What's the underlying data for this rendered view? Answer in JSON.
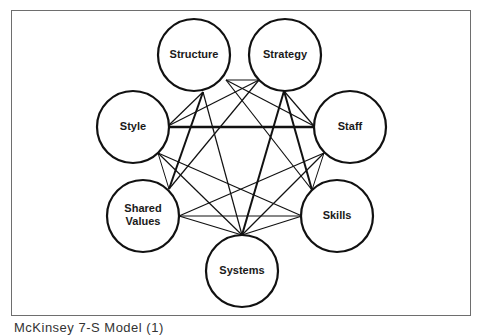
{
  "diagram": {
    "frame_color": "#6e6e6e",
    "stroke_color": "#111111",
    "nodes": [
      {
        "id": "structure",
        "label": "Structure",
        "lines": [
          "Structure"
        ],
        "cx": 194,
        "cy": 55,
        "r": 36
      },
      {
        "id": "strategy",
        "label": "Strategy",
        "lines": [
          "Strategy"
        ],
        "cx": 285,
        "cy": 55,
        "r": 36
      },
      {
        "id": "style",
        "label": "Style",
        "lines": [
          "Style"
        ],
        "cx": 133,
        "cy": 127,
        "r": 36
      },
      {
        "id": "staff",
        "label": "Staff",
        "lines": [
          "Staff"
        ],
        "cx": 350,
        "cy": 127,
        "r": 36
      },
      {
        "id": "shared-values",
        "label": "Shared Values",
        "lines": [
          "Shared",
          "Values"
        ],
        "cx": 143,
        "cy": 216,
        "r": 36
      },
      {
        "id": "skills",
        "label": "Skills",
        "lines": [
          "Skills"
        ],
        "cx": 337,
        "cy": 216,
        "r": 36
      },
      {
        "id": "systems",
        "label": "Systems",
        "lines": [
          "Systems"
        ],
        "cx": 242,
        "cy": 271,
        "r": 36
      }
    ],
    "edges": [
      {
        "from": "structure",
        "to": "strategy",
        "x1": 226,
        "y1": 80,
        "x2": 259,
        "y2": 80,
        "w": 1.2
      },
      {
        "from": "structure",
        "to": "style",
        "x1": 203,
        "y1": 92,
        "x2": 168,
        "y2": 126,
        "w": 1.2
      },
      {
        "from": "structure",
        "to": "staff",
        "x1": 226,
        "y1": 80,
        "x2": 314,
        "y2": 126,
        "w": 1.2
      },
      {
        "from": "structure",
        "to": "shared-values",
        "x1": 203,
        "y1": 92,
        "x2": 169,
        "y2": 189,
        "w": 2
      },
      {
        "from": "structure",
        "to": "skills",
        "x1": 226,
        "y1": 80,
        "x2": 312,
        "y2": 190,
        "w": 1.2
      },
      {
        "from": "structure",
        "to": "systems",
        "x1": 203,
        "y1": 92,
        "x2": 242,
        "y2": 235,
        "w": 1.2
      },
      {
        "from": "strategy",
        "to": "style",
        "x1": 259,
        "y1": 80,
        "x2": 168,
        "y2": 126,
        "w": 1.2
      },
      {
        "from": "strategy",
        "to": "staff",
        "x1": 284,
        "y1": 91,
        "x2": 314,
        "y2": 126,
        "w": 1.2
      },
      {
        "from": "strategy",
        "to": "shared-values",
        "x1": 259,
        "y1": 80,
        "x2": 169,
        "y2": 189,
        "w": 1.2
      },
      {
        "from": "strategy",
        "to": "skills",
        "x1": 284,
        "y1": 91,
        "x2": 312,
        "y2": 190,
        "w": 2
      },
      {
        "from": "strategy",
        "to": "systems",
        "x1": 284,
        "y1": 91,
        "x2": 242,
        "y2": 235,
        "w": 2
      },
      {
        "from": "style",
        "to": "staff",
        "x1": 168,
        "y1": 127,
        "x2": 314,
        "y2": 127,
        "w": 2.4
      },
      {
        "from": "style",
        "to": "shared-values",
        "x1": 158,
        "y1": 153,
        "x2": 169,
        "y2": 189,
        "w": 1
      },
      {
        "from": "style",
        "to": "skills",
        "x1": 158,
        "y1": 153,
        "x2": 302,
        "y2": 216,
        "w": 1.2
      },
      {
        "from": "style",
        "to": "systems",
        "x1": 158,
        "y1": 153,
        "x2": 242,
        "y2": 235,
        "w": 1.2
      },
      {
        "from": "staff",
        "to": "shared-values",
        "x1": 324,
        "y1": 153,
        "x2": 179,
        "y2": 216,
        "w": 1.2
      },
      {
        "from": "staff",
        "to": "skills",
        "x1": 324,
        "y1": 153,
        "x2": 312,
        "y2": 190,
        "w": 1
      },
      {
        "from": "staff",
        "to": "systems",
        "x1": 324,
        "y1": 153,
        "x2": 242,
        "y2": 235,
        "w": 1.2
      },
      {
        "from": "shared-values",
        "to": "skills",
        "x1": 179,
        "y1": 216,
        "x2": 302,
        "y2": 216,
        "w": 1.2
      },
      {
        "from": "shared-values",
        "to": "systems",
        "x1": 179,
        "y1": 216,
        "x2": 242,
        "y2": 235,
        "w": 1.2
      },
      {
        "from": "skills",
        "to": "systems",
        "x1": 302,
        "y1": 216,
        "x2": 242,
        "y2": 235,
        "w": 1.2
      }
    ]
  },
  "caption": {
    "text": "McKinsey 7-S Model (1)"
  }
}
